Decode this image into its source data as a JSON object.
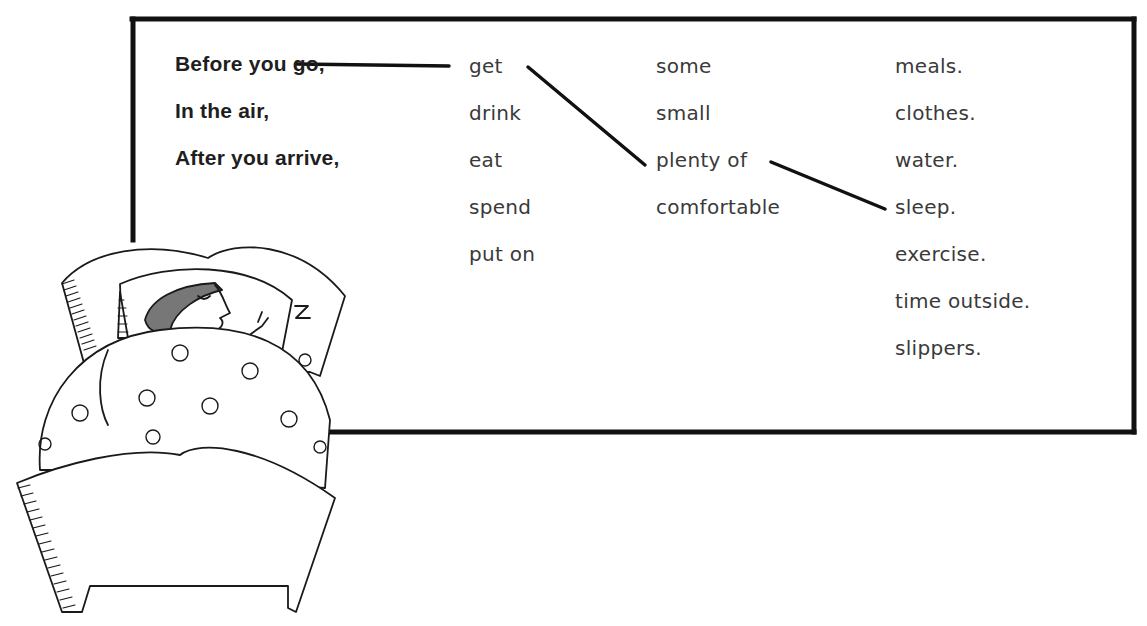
{
  "exercise": {
    "title_fragment": "",
    "stems": [
      "Before you go,",
      "In the air,",
      "After you arrive,"
    ],
    "verbs": [
      "get",
      "drink",
      "eat",
      "spend",
      "put on"
    ],
    "quantifiers": [
      "some",
      "small",
      "plenty of",
      "comfortable"
    ],
    "nouns": [
      "meals.",
      "clothes.",
      "water.",
      "sleep.",
      "exercise.",
      "time outside.",
      "slippers."
    ],
    "example_connection": {
      "stem": "Before you go,",
      "verb": "get",
      "quantifier": "plenty of",
      "noun": "sleep."
    }
  },
  "illustration": {
    "description": "Woman sleeping in bed under a flowered quilt",
    "z_label": "Z"
  },
  "colors": {
    "border": "#111111",
    "text_stem": "#1e1e1e",
    "text_word": "#3a3a3a",
    "background": "#ffffff"
  }
}
